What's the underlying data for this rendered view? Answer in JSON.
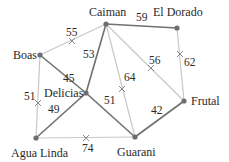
{
  "diagram": {
    "type": "weighted-graph-minimum-spanning-tree",
    "colors": {
      "tree_edge": "#707070",
      "removed_edge": "#c8c8c8",
      "node": "#6e6e6e",
      "cross_mark": "#8a8a8a",
      "text": "#2a2a2a"
    },
    "nodes": [
      {
        "id": "caiman",
        "label": "Caiman",
        "x": 106,
        "y": 24
      },
      {
        "id": "eldorado",
        "label": "El Dorado",
        "x": 177,
        "y": 28
      },
      {
        "id": "boas",
        "label": "Boas",
        "x": 40,
        "y": 55
      },
      {
        "id": "delicias",
        "label": "Delicias",
        "x": 86,
        "y": 93
      },
      {
        "id": "frutal",
        "label": "Frutal",
        "x": 184,
        "y": 101
      },
      {
        "id": "agualinda",
        "label": "Agua Linda",
        "x": 36,
        "y": 138
      },
      {
        "id": "guarani",
        "label": "Guarani",
        "x": 135,
        "y": 137
      }
    ],
    "edges": [
      {
        "from": "caiman",
        "to": "eldorado",
        "weight": "59",
        "in_tree": true
      },
      {
        "from": "caiman",
        "to": "boas",
        "weight": "55",
        "in_tree": false
      },
      {
        "from": "caiman",
        "to": "delicias",
        "weight": "53",
        "in_tree": true
      },
      {
        "from": "boas",
        "to": "delicias",
        "weight": "45",
        "in_tree": true
      },
      {
        "from": "caiman",
        "to": "guarani",
        "weight": "64",
        "in_tree": false
      },
      {
        "from": "caiman",
        "to": "frutal",
        "weight": "56",
        "in_tree": false
      },
      {
        "from": "eldorado",
        "to": "frutal",
        "weight": "62",
        "in_tree": false
      },
      {
        "from": "boas",
        "to": "agualinda",
        "weight": "51",
        "in_tree": false
      },
      {
        "from": "delicias",
        "to": "agualinda",
        "weight": "49",
        "in_tree": true
      },
      {
        "from": "delicias",
        "to": "guarani",
        "weight": "51",
        "in_tree": true
      },
      {
        "from": "agualinda",
        "to": "guarani",
        "weight": "74",
        "in_tree": false
      },
      {
        "from": "guarani",
        "to": "frutal",
        "weight": "42",
        "in_tree": true
      }
    ]
  }
}
